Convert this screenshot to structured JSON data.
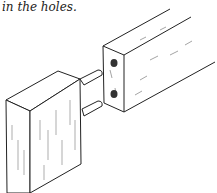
{
  "caption": "in the holes.",
  "illustration": {
    "subject": "dowel-joint",
    "parts": [
      "rail",
      "dowel-holes",
      "dowels",
      "post"
    ]
  }
}
